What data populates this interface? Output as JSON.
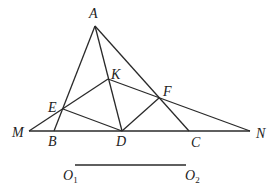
{
  "diagram": {
    "points": {
      "A": {
        "label": "A",
        "x": 95,
        "y": 26
      },
      "K": {
        "label": "K",
        "x": 108,
        "y": 79
      },
      "F": {
        "label": "F",
        "x": 159,
        "y": 98
      },
      "E": {
        "label": "E",
        "x": 63,
        "y": 109
      },
      "M": {
        "label": "M",
        "x": 29,
        "y": 131
      },
      "B": {
        "label": "B",
        "x": 54,
        "y": 131
      },
      "D": {
        "label": "D",
        "x": 122,
        "y": 131
      },
      "C": {
        "label": "C",
        "x": 189,
        "y": 131
      },
      "N": {
        "label": "N",
        "x": 250,
        "y": 131
      }
    },
    "segments": [
      [
        "M",
        "N"
      ],
      [
        "A",
        "B"
      ],
      [
        "A",
        "C"
      ],
      [
        "A",
        "D"
      ],
      [
        "M",
        "F"
      ],
      [
        "E",
        "K"
      ],
      [
        "K",
        "N"
      ],
      [
        "E",
        "D"
      ],
      [
        "D",
        "F"
      ]
    ],
    "reference_segment": {
      "start_label": "O",
      "start_sub": "1",
      "end_label": "O",
      "end_sub": "2"
    }
  }
}
